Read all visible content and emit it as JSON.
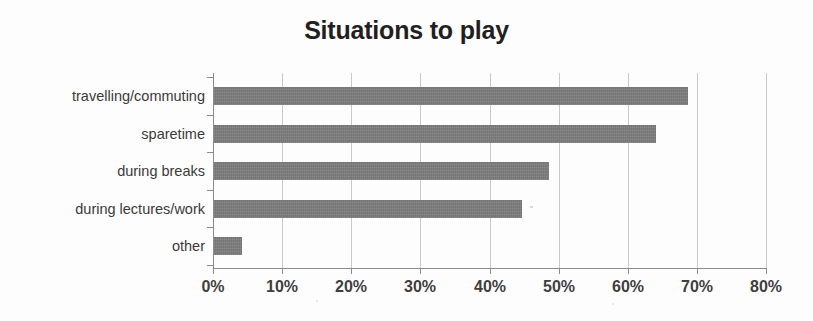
{
  "chart_data": {
    "type": "bar",
    "orientation": "horizontal",
    "title": "Situations to play",
    "xlabel": "",
    "ylabel": "",
    "categories": [
      "travelling/commuting",
      "sparetime",
      "during breaks",
      "during lectures/work",
      "other"
    ],
    "values": [
      68.5,
      64,
      48.5,
      44.5,
      4
    ],
    "value_suffix": "%",
    "xlim": [
      0,
      80
    ],
    "xticks": [
      0,
      10,
      20,
      30,
      40,
      50,
      60,
      70,
      80
    ],
    "xticklabels": [
      "0%",
      "10%",
      "20%",
      "30%",
      "40%",
      "50%",
      "60%",
      "70%",
      "80%"
    ],
    "grid": "vertical",
    "legend": "none",
    "series": [
      {
        "name": "Situations to play",
        "values": [
          68.5,
          64,
          48.5,
          44.5,
          4
        ]
      }
    ],
    "colors": {
      "bar": "#7d7d7d",
      "axis": "#8a8a8a",
      "grid": "#c9c9c9",
      "title_text": "#231f20",
      "label_text": "#3a3a3a",
      "background": "#fdfdfd"
    }
  }
}
